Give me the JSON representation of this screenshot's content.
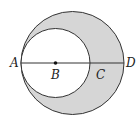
{
  "diagram": {
    "type": "geometry",
    "colors": {
      "shade": "#d6d6d6",
      "stroke": "#333333",
      "background": "#ffffff"
    },
    "outer_circle": {
      "cx": 72.5,
      "cy": 63,
      "r": 51.5
    },
    "inner_circle": {
      "cx": 55.5,
      "cy": 63,
      "r": 34.5
    },
    "diameter_line": {
      "x1": 21,
      "y1": 63,
      "x2": 124,
      "y2": 63
    },
    "points": [
      {
        "label": "A",
        "x": 21,
        "y": 63
      },
      {
        "label": "B",
        "x": 55.5,
        "y": 63
      },
      {
        "label": "C",
        "x": 90,
        "y": 63
      },
      {
        "label": "D",
        "x": 124,
        "y": 63
      }
    ],
    "labels": {
      "A": "A",
      "B": "B",
      "C": "C",
      "D": "D"
    }
  }
}
